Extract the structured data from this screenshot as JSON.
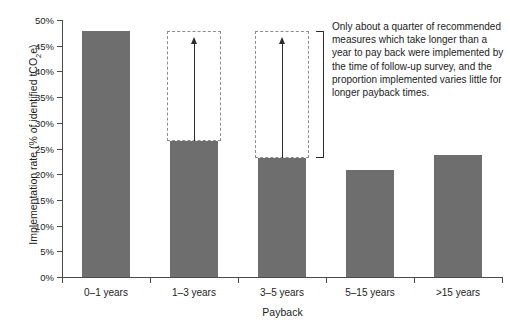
{
  "chart_data": {
    "type": "bar",
    "title": "",
    "xlabel": "Payback",
    "ylabel": "Implementation rate (% of identified tCO2e)",
    "categories": [
      "0–1 years",
      "1–3 years",
      "3–5 years",
      "5–15 years",
      ">15 years"
    ],
    "values": [
      47.8,
      26.5,
      23.2,
      20.8,
      23.7
    ],
    "ylim": [
      0,
      50
    ],
    "ytick_values": [
      0,
      5,
      10,
      15,
      20,
      25,
      30,
      35,
      40,
      45,
      50
    ],
    "ytick_labels": [
      "0%",
      "5%",
      "10%",
      "15%",
      "20%",
      "25%",
      "30%",
      "35%",
      "40%",
      "45%",
      "50%"
    ],
    "grid": false,
    "legend": "none",
    "bar_color": "#6e6e6e",
    "axis_color": "#4a4a4a",
    "annotations": [
      {
        "name": "potential-box-1-3-years",
        "category": "1–3 years",
        "type": "dashed-rectangle",
        "top_value": 47.8,
        "bottom_value": 26.5
      },
      {
        "name": "potential-box-3-5-years",
        "category": "3–5 years",
        "type": "dashed-rectangle",
        "top_value": 47.8,
        "bottom_value": 23.2
      },
      {
        "name": "gap-arrow-1-3-years",
        "type": "up-arrow",
        "from_value": 26.5,
        "to_value": 45.5
      },
      {
        "name": "gap-arrow-3-5-years",
        "type": "up-arrow",
        "from_value": 23.2,
        "to_value": 45.5
      },
      {
        "name": "callout-bracket",
        "type": "bracket",
        "top_value": 47.8,
        "bottom_value": 23.2
      }
    ]
  },
  "axis_titles": {
    "x": "Payback",
    "y_prefix": "Implementation rate (% of identified tCO",
    "y_sub": "2",
    "y_suffix": "e)"
  },
  "annotation_text": {
    "body": "Only about a quarter of recommended measures which take longer than a year to pay back were implemented by the time of follow-up survey, and the proportion implemented varies little for longer payback times."
  }
}
